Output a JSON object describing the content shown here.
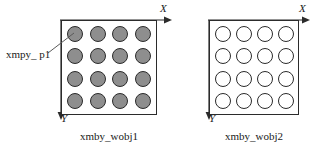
{
  "diagram": {
    "type": "workobject-grid-comparison",
    "background_color": "#ffffff",
    "line_color": "#2b2b2b",
    "objects": [
      {
        "id": "wobj1",
        "caption": "xmby_wobj1",
        "axis_x_label": "X",
        "axis_y_label": "Y",
        "grid_rows": 4,
        "grid_cols": 4,
        "circle_count": 16,
        "circle_fill": "#8e8e8e",
        "circle_style": "filled",
        "callout": {
          "label": "xmpy_ p1",
          "points_to": "first-circle-top-left"
        }
      },
      {
        "id": "wobj2",
        "caption": "xmby_wobj2",
        "axis_x_label": "X",
        "axis_y_label": "Y",
        "grid_rows": 4,
        "grid_cols": 4,
        "circle_count": 16,
        "circle_fill": "#ffffff",
        "circle_style": "hollow",
        "callout": null
      }
    ]
  }
}
